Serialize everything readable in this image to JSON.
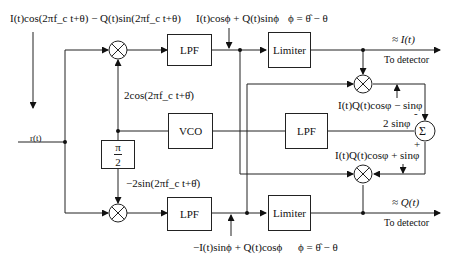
{
  "diagram": {
    "input": {
      "signal_label": "I(t)cos(2πf_c t+θ) − Q(t)sin(2πf_c t+θ)",
      "node_label": "r(t)"
    },
    "blocks": {
      "lpf_top": "LPF",
      "lpf_bottom": "LPF",
      "lpf_loop": "LPF",
      "limiter_top": "Limiter",
      "limiter_bottom": "Limiter",
      "vco": "VCO",
      "phase_shift_num": "π",
      "phase_shift_den": "2",
      "summer": "Σ",
      "multiplier": "⊗"
    },
    "labels": {
      "top_lpf_out": "I(t)cosϕ + Q(t)sinϕ",
      "top_phi_def": "ϕ = θ̂ − θ",
      "vco_cos": "2cos(2πf_c t+θ̂)",
      "vco_sin": "−2sin(2πf_c t+θ̂)",
      "bottom_lpf_out": "−I(t)sinϕ + Q(t)cosϕ",
      "bottom_phi_def": "ϕ = θ̂ − θ",
      "top_output": "≈ I(t)",
      "top_output_dest": "To detector",
      "bottom_output": "≈ Q(t)",
      "bottom_output_dest": "To detector",
      "upper_product": "I(t)Q(t)cosφ − sinφ",
      "lower_product": "I(t)Q(t)cosφ + sinφ",
      "sum_out": "2 sinφ",
      "minus_sign": "-",
      "plus_sign": "+"
    }
  }
}
